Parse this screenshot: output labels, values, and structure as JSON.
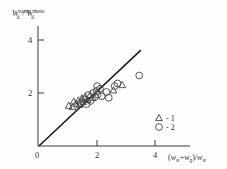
{
  "chart_data": {
    "type": "scatter",
    "title": "",
    "subtitle": "",
    "ylabel": "W_d^comp / W_d^meas",
    "ylabel_parts": {
      "base1": "W",
      "sub1": "d",
      "sup1": "comp",
      "divider": " / ",
      "base2": "W",
      "sub2": "d",
      "sup2": "meas"
    },
    "xlabel": "(w_st+w_g)/w_st",
    "xlabel_parts": {
      "open": "(",
      "base1": "w",
      "sub1": "st",
      "plus": "+",
      "base2": "w",
      "sub2": "g",
      "close_div": ")/",
      "base3": "w",
      "sub3": "st"
    },
    "xlim": [
      0,
      4.6
    ],
    "ylim": [
      0,
      4.5
    ],
    "xticks": [
      0,
      2,
      4
    ],
    "xticklabels": [
      "0",
      "2",
      "4"
    ],
    "yticks": [
      2,
      4
    ],
    "yticklabels": [
      "2",
      "4"
    ],
    "grid": false,
    "legend_position": "lower-right",
    "reference_line": {
      "label": "1:1 identity line",
      "x": [
        0.05,
        3.5
      ],
      "y": [
        0.02,
        3.6
      ]
    },
    "series": [
      {
        "name": "1",
        "marker": "triangle",
        "legend_label": "- 1",
        "points": [
          [
            1.05,
            1.52
          ],
          [
            1.18,
            1.47
          ],
          [
            1.22,
            1.68
          ],
          [
            1.3,
            1.6
          ],
          [
            1.38,
            1.72
          ],
          [
            1.42,
            1.55
          ],
          [
            1.5,
            1.8
          ],
          [
            1.55,
            1.66
          ],
          [
            1.62,
            1.86
          ],
          [
            1.7,
            1.74
          ],
          [
            1.78,
            1.92
          ],
          [
            1.86,
            1.82
          ],
          [
            2.58,
            2.1
          ],
          [
            2.88,
            2.3
          ]
        ]
      },
      {
        "name": "2",
        "marker": "circle",
        "legend_label": "- 2",
        "points": [
          [
            1.46,
            1.62
          ],
          [
            1.58,
            1.76
          ],
          [
            1.66,
            1.58
          ],
          [
            1.72,
            1.92
          ],
          [
            1.8,
            1.7
          ],
          [
            1.88,
            2.0
          ],
          [
            1.94,
            1.84
          ],
          [
            2.0,
            2.08
          ],
          [
            2.04,
            1.94
          ],
          [
            2.02,
            2.26
          ],
          [
            2.12,
            2.16
          ],
          [
            2.18,
            1.88
          ],
          [
            2.34,
            2.04
          ],
          [
            2.42,
            1.82
          ],
          [
            2.62,
            2.26
          ],
          [
            2.72,
            2.36
          ],
          [
            3.46,
            2.66
          ]
        ]
      }
    ]
  },
  "legend": {
    "items": [
      {
        "marker": "triangle",
        "label": "- 1"
      },
      {
        "marker": "circle",
        "label": "- 2"
      }
    ]
  }
}
